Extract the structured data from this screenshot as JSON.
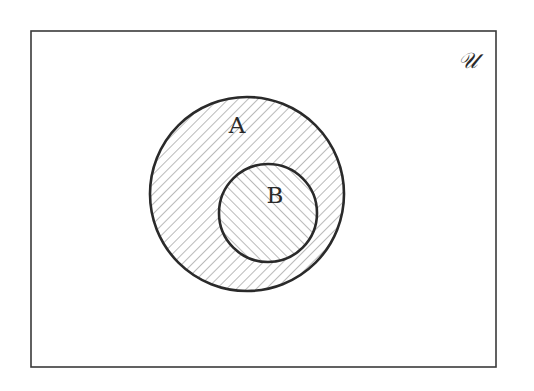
{
  "diagram": {
    "type": "venn",
    "universe": {
      "label": "𝒰",
      "x": 31,
      "y": 31,
      "width": 465,
      "height": 336
    },
    "sets": [
      {
        "name": "A",
        "label": "A",
        "cx": 247,
        "cy": 194,
        "r": 97,
        "hatch": "forward"
      },
      {
        "name": "B",
        "label": "B",
        "cx": 268,
        "cy": 213,
        "r": 49,
        "hatch": "backward"
      }
    ],
    "relationship": "B is a subset of A",
    "colors": {
      "stroke": "#2a2a2a",
      "hatch": "#a8a8a8",
      "background": "#ffffff"
    }
  }
}
